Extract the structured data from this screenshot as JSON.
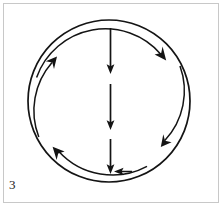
{
  "figure": {
    "number_label": "3",
    "caption": "",
    "frame_color": "#c8c8c8",
    "background_color": "#ffffff",
    "stroke_color": "#141414",
    "width": 223,
    "height": 208
  },
  "diagram": {
    "type": "circular-flow",
    "center": {
      "x": 109,
      "y": 101
    },
    "outer_circle": {
      "name": "outer-circle",
      "radius": 81,
      "stroke_width": 1.6,
      "closed": true
    },
    "inner_ring": {
      "name": "inner-arrow-ring",
      "radius": 73,
      "stroke_width": 1.4,
      "direction": "clockwise",
      "segment_count": 4,
      "segments": [
        {
          "name": "arc-top-right",
          "start_deg": 182,
          "end_deg": 268,
          "arrowhead_deg": 268,
          "arrowhead_direction": "down-right"
        },
        {
          "name": "arc-bottom-right",
          "start_deg": 272,
          "end_deg": 358,
          "arrowhead_deg": 358,
          "arrowhead_direction": "down-left"
        },
        {
          "name": "arc-bottom-left",
          "start_deg": 2,
          "end_deg": 88,
          "arrowhead_deg": 88,
          "arrowhead_direction": "up-left"
        },
        {
          "name": "arc-top-left",
          "start_deg": 92,
          "end_deg": 178,
          "arrowhead_deg": 178,
          "arrowhead_direction": "up-right"
        }
      ]
    },
    "center_arrows": {
      "name": "center-down-arrows",
      "count": 3,
      "x": 110,
      "direction": "down",
      "stroke_width": 1.6,
      "items": [
        {
          "name": "center-arrow-top",
          "y_start": 28,
          "y_end": 73
        },
        {
          "name": "center-arrow-middle",
          "y_start": 84,
          "y_end": 129
        },
        {
          "name": "center-arrow-bottom",
          "y_start": 139,
          "y_end": 174
        }
      ]
    },
    "bottom_inbound_arrow": {
      "name": "bottom-left-pointing-arrow",
      "direction": "left",
      "tip": {
        "x": 114,
        "y": 172
      },
      "tail": {
        "x": 132,
        "y": 172
      }
    }
  }
}
